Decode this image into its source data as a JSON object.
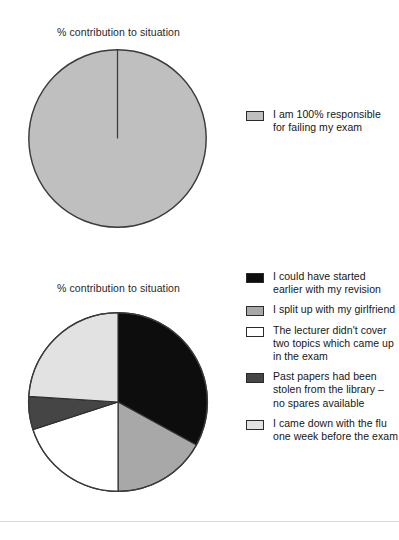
{
  "charts": [
    {
      "title": "% contribution to situation",
      "legend": [
        {
          "label": "I am 100% responsible for failing my exam",
          "color": "#bfbfbf",
          "swatch_name": "legend-swatch-gray"
        }
      ]
    },
    {
      "title": "% contribution to situation",
      "legend": [
        {
          "label": "I could have started earlier with my revision",
          "color": "#0d0d0d",
          "swatch_name": "legend-swatch-black"
        },
        {
          "label": "I split up with my girlfriend",
          "color": "#a8a8a8",
          "swatch_name": "legend-swatch-mid-gray"
        },
        {
          "label": "The lecturer didn't cover two topics which came up in the exam",
          "color": "#ffffff",
          "swatch_name": "legend-swatch-white"
        },
        {
          "label": "Past papers had been stolen from the library – no spares available",
          "color": "#454545",
          "swatch_name": "legend-swatch-dark-gray"
        },
        {
          "label": "I came down with the flu one week before the exam",
          "color": "#e2e2e2",
          "swatch_name": "legend-swatch-light-gray"
        }
      ]
    }
  ],
  "chart_data": [
    {
      "type": "pie",
      "title": "% contribution to situation",
      "labels": [
        "I am 100% responsible for failing my exam"
      ],
      "values": [
        100
      ],
      "colors": [
        "#bfbfbf"
      ],
      "start_angle_deg": 0,
      "legend_position": "right",
      "grid": false,
      "units": "%"
    },
    {
      "type": "pie",
      "title": "% contribution to situation",
      "labels": [
        "I could have started earlier with my revision",
        "I split up with my girlfriend",
        "The lecturer didn't cover two topics which came up in the exam",
        "Past papers had been stolen from the library – no spares available",
        "I came down with the flu one week before the exam"
      ],
      "values": [
        33,
        17,
        20,
        6,
        24
      ],
      "colors": [
        "#0d0d0d",
        "#a8a8a8",
        "#ffffff",
        "#454545",
        "#e2e2e2"
      ],
      "start_angle_deg": 0,
      "legend_position": "right",
      "grid": false,
      "units": "%"
    }
  ]
}
